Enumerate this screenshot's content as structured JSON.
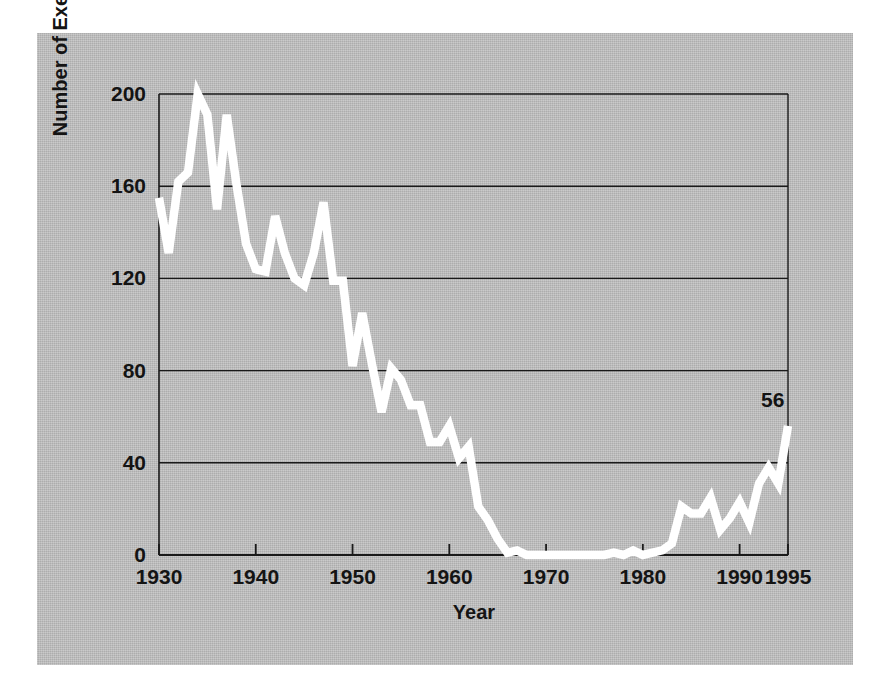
{
  "figure": {
    "background_color": "#ffffff",
    "panel_color": "#bcbcbc",
    "line_color": "#ffffff",
    "axis_color": "#1a1a1a",
    "text_color": "#141414"
  },
  "annotation": {
    "endpoint_label": "56"
  },
  "chart_data": {
    "type": "line",
    "title": "",
    "xlabel": "Year",
    "ylabel": "Number of Executions",
    "xlim": [
      1930,
      1995
    ],
    "ylim": [
      0,
      200
    ],
    "grid": true,
    "grid_axis": "y",
    "legend": false,
    "xticks": [
      1930,
      1940,
      1950,
      1960,
      1970,
      1980,
      1990,
      1995
    ],
    "xtick_labels": [
      "1930",
      "1940",
      "1950",
      "1960",
      "1970",
      "1980",
      "1990",
      "1995"
    ],
    "yticks": [
      0,
      40,
      80,
      120,
      160,
      200
    ],
    "ytick_labels": [
      "0",
      "40",
      "80",
      "120",
      "160",
      "200"
    ],
    "series": [
      {
        "name": "Number of Executions",
        "color": "#ffffff",
        "x": [
          1930,
          1931,
          1932,
          1933,
          1934,
          1935,
          1936,
          1937,
          1938,
          1939,
          1940,
          1941,
          1942,
          1943,
          1944,
          1945,
          1946,
          1947,
          1948,
          1949,
          1950,
          1951,
          1952,
          1953,
          1954,
          1955,
          1956,
          1957,
          1958,
          1959,
          1960,
          1961,
          1962,
          1963,
          1964,
          1965,
          1966,
          1967,
          1968,
          1969,
          1970,
          1971,
          1972,
          1973,
          1974,
          1975,
          1976,
          1977,
          1978,
          1979,
          1980,
          1981,
          1982,
          1983,
          1984,
          1985,
          1986,
          1987,
          1988,
          1989,
          1990,
          1991,
          1992,
          1993,
          1994,
          1995
        ],
        "values": [
          155,
          131,
          162,
          166,
          200,
          191,
          150,
          191,
          161,
          135,
          124,
          123,
          147,
          131,
          120,
          117,
          131,
          153,
          119,
          119,
          82,
          105,
          83,
          62,
          81,
          76,
          65,
          65,
          49,
          49,
          56,
          42,
          47,
          21,
          15,
          7,
          1,
          2,
          0,
          0,
          0,
          0,
          0,
          0,
          0,
          0,
          0,
          1,
          0,
          2,
          0,
          1,
          2,
          5,
          21,
          18,
          18,
          25,
          11,
          16,
          23,
          14,
          31,
          38,
          31,
          56
        ]
      }
    ],
    "annotations": [
      {
        "x": 1995,
        "y": 56,
        "text": "56"
      }
    ]
  },
  "axis_labels": {
    "y": [
      {
        "text": "200",
        "value": 200
      },
      {
        "text": "160",
        "value": 160
      },
      {
        "text": "120",
        "value": 120
      },
      {
        "text": "80",
        "value": 80
      },
      {
        "text": "40",
        "value": 40
      },
      {
        "text": "0",
        "value": 0
      }
    ],
    "x": [
      {
        "text": "1930",
        "value": 1930
      },
      {
        "text": "1940",
        "value": 1940
      },
      {
        "text": "1950",
        "value": 1950
      },
      {
        "text": "1960",
        "value": 1960
      },
      {
        "text": "1970",
        "value": 1970
      },
      {
        "text": "1980",
        "value": 1980
      },
      {
        "text": "1990",
        "value": 1990
      },
      {
        "text": "1995",
        "value": 1995
      }
    ]
  }
}
